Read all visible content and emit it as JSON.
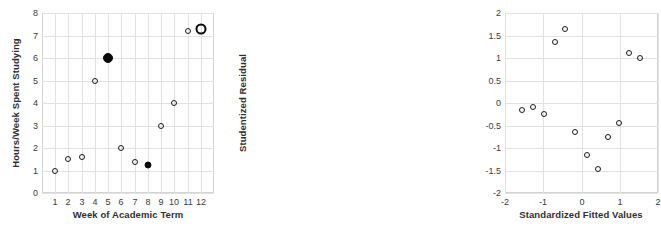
{
  "figure": {
    "width": 451,
    "height": 237,
    "background": "#ffffff",
    "grid_color": "#e2e2e2",
    "point_color": "#0a0a0a"
  },
  "chart_data": [
    {
      "type": "scatter",
      "title": "",
      "xlabel": "Week of Academic Term",
      "ylabel": "Hours/Week Spent Studying",
      "xlim": [
        0,
        13
      ],
      "ylim": [
        0,
        8
      ],
      "xticks": [
        "1",
        "2",
        "3",
        "4",
        "5",
        "6",
        "7",
        "8",
        "9",
        "10",
        "11",
        "12"
      ],
      "xtick_values": [
        1,
        2,
        3,
        4,
        5,
        6,
        7,
        8,
        9,
        10,
        11,
        12
      ],
      "yticks": [
        "0",
        "1",
        "2",
        "3",
        "4",
        "5",
        "6",
        "7",
        "8"
      ],
      "ytick_values": [
        0,
        1,
        2,
        3,
        4,
        5,
        6,
        7,
        8
      ],
      "grid": true,
      "legend": "none",
      "x": [
        1,
        2,
        3,
        4,
        5,
        6,
        7,
        8,
        9,
        10,
        11,
        12
      ],
      "y": [
        1.0,
        1.5,
        1.6,
        5.0,
        6.0,
        2.0,
        1.4,
        1.25,
        3.0,
        4.0,
        7.2,
        7.3
      ],
      "marker_styles": [
        "open",
        "open",
        "open",
        "open",
        "filled",
        "open",
        "open",
        "filled-small",
        "open",
        "open",
        "open",
        "ring"
      ],
      "points": [
        {
          "x": 1,
          "y": 1.0,
          "style": "open"
        },
        {
          "x": 2,
          "y": 1.5,
          "style": "open"
        },
        {
          "x": 3,
          "y": 1.6,
          "style": "open"
        },
        {
          "x": 4,
          "y": 5.0,
          "style": "open"
        },
        {
          "x": 5,
          "y": 6.0,
          "style": "filled"
        },
        {
          "x": 6,
          "y": 2.0,
          "style": "open"
        },
        {
          "x": 7,
          "y": 1.4,
          "style": "open"
        },
        {
          "x": 8,
          "y": 1.25,
          "style": "filled-small"
        },
        {
          "x": 9,
          "y": 3.0,
          "style": "open"
        },
        {
          "x": 10,
          "y": 4.0,
          "style": "open"
        },
        {
          "x": 11,
          "y": 7.2,
          "style": "open"
        },
        {
          "x": 12,
          "y": 7.3,
          "style": "ring"
        }
      ]
    },
    {
      "type": "scatter",
      "title": "",
      "xlabel": "Standardized Fitted Values",
      "ylabel": "Studentized Residual",
      "xlim": [
        -2,
        2
      ],
      "ylim": [
        -2,
        2
      ],
      "xticks": [
        "-2",
        "-1",
        "0",
        "1",
        "2"
      ],
      "xtick_values": [
        -2,
        -1,
        0,
        1,
        2
      ],
      "yticks": [
        "-2",
        "-1.5",
        "-1",
        "-0.5",
        "0",
        "0.5",
        "1",
        "1.5",
        "2"
      ],
      "ytick_values": [
        -2,
        -1.5,
        -1,
        -0.5,
        0,
        0.5,
        1,
        1.5,
        2
      ],
      "grid": true,
      "legend": "none",
      "x": [
        -1.55,
        -1.27,
        -0.98,
        -0.68,
        -0.42,
        -0.17,
        0.15,
        0.43,
        0.7,
        0.97,
        1.25,
        1.52
      ],
      "y": [
        -0.16,
        -0.09,
        -0.25,
        1.35,
        1.64,
        -0.65,
        -1.16,
        -1.46,
        -0.76,
        -0.45,
        1.12,
        1.0
      ],
      "marker_styles": [
        "open",
        "open",
        "open",
        "open",
        "open",
        "open",
        "open",
        "open",
        "open",
        "open",
        "open",
        "open"
      ],
      "points": [
        {
          "x": -1.55,
          "y": -0.16,
          "style": "open"
        },
        {
          "x": -1.27,
          "y": -0.09,
          "style": "open"
        },
        {
          "x": -0.98,
          "y": -0.25,
          "style": "open"
        },
        {
          "x": -0.68,
          "y": 1.35,
          "style": "open"
        },
        {
          "x": -0.42,
          "y": 1.64,
          "style": "open"
        },
        {
          "x": -0.17,
          "y": -0.65,
          "style": "open"
        },
        {
          "x": 0.15,
          "y": -1.16,
          "style": "open"
        },
        {
          "x": 0.43,
          "y": -1.46,
          "style": "open"
        },
        {
          "x": 0.7,
          "y": -0.76,
          "style": "open"
        },
        {
          "x": 0.97,
          "y": -0.45,
          "style": "open"
        },
        {
          "x": 1.25,
          "y": 1.12,
          "style": "open"
        },
        {
          "x": 1.52,
          "y": 1.0,
          "style": "open"
        }
      ]
    }
  ],
  "panels": [
    {
      "name": "left",
      "plot": {
        "left": 42,
        "top": 13,
        "width": 172,
        "height": 180
      }
    },
    {
      "name": "right",
      "plot": {
        "left": 280,
        "top": 13,
        "width": 153,
        "height": 180
      }
    }
  ]
}
